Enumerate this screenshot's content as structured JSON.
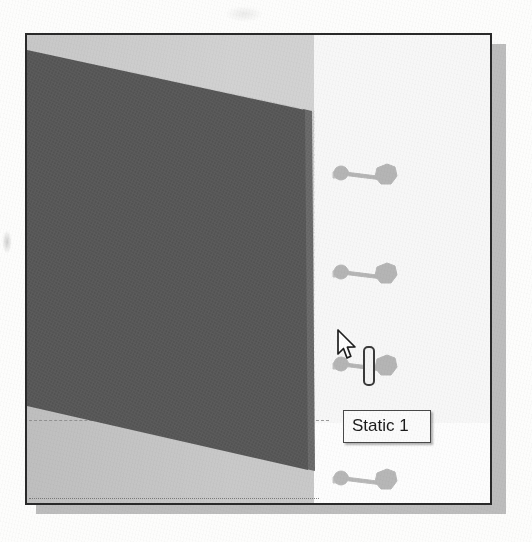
{
  "figure": {
    "kind": "cad-fea-viewport-screenshot"
  },
  "viewport": {
    "background_upper_color": "#d2d2d2",
    "background_lower_color": "#c9c9c9",
    "background_right_color": "#f7f7f7",
    "border_color": "#2a2a2a",
    "shadow_color": "#bdbdbd"
  },
  "selected_face": {
    "label": "selected-plate-face",
    "fill_color": "#5c5c5c",
    "edge_color": "#6e6e6e"
  },
  "fixtures": {
    "symbol_label": "fixture-restraint-arrow",
    "count": 4,
    "color": "#8d8d8d",
    "items": [
      {
        "id": "fixture-1"
      },
      {
        "id": "fixture-2"
      },
      {
        "id": "fixture-3"
      },
      {
        "id": "fixture-4"
      }
    ]
  },
  "tooltip": {
    "text": "Static 1",
    "background_color": "#fbfbfb",
    "border_color": "#4a4a4a",
    "text_color": "#1c1c1c"
  },
  "cursor": {
    "icon": "arrow-pointer-icon",
    "badge_icon": "label-marker-icon",
    "fill_color": "#ffffff",
    "outline_color": "#1f1f1f"
  },
  "construction_lines": {
    "mid_line_style": "dashed",
    "low_line_style": "dotted",
    "color": "#8a8a8a"
  }
}
